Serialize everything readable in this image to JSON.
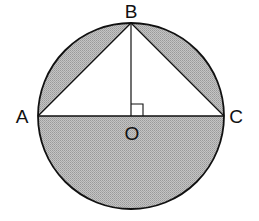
{
  "diagram": {
    "type": "circle-with-inscribed-triangle",
    "labels": {
      "A": "A",
      "B": "B",
      "C": "C",
      "O": "O"
    },
    "geometry": {
      "center": [
        131,
        116
      ],
      "radius": 93
    },
    "colors": {
      "shade": "#b9b9b9",
      "stroke": "#111111",
      "background": "#ffffff"
    },
    "shaded_regions": [
      "segment-AB",
      "segment-BC",
      "lower-semicircle"
    ],
    "right_angle_at": "O"
  }
}
